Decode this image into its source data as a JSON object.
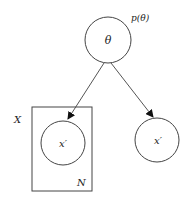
{
  "diagram": {
    "title": "",
    "nodes": [
      {
        "id": "theta",
        "label": "θ",
        "annotation": "p(θ)",
        "cx": 108,
        "cy": 40,
        "r": 23
      },
      {
        "id": "x_plate",
        "label": "x′",
        "cx": 63,
        "cy": 143,
        "r": 22
      },
      {
        "id": "x_single",
        "label": "x′",
        "cx": 157,
        "cy": 140,
        "r": 22
      }
    ],
    "plate": {
      "label_outer": "X",
      "label_count": "N"
    },
    "edges": [
      {
        "from": "theta",
        "to": "x_plate"
      },
      {
        "from": "theta",
        "to": "x_single"
      }
    ],
    "colors": {
      "stroke": "#444444",
      "background": "#ffffff"
    }
  }
}
